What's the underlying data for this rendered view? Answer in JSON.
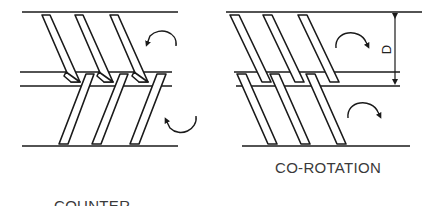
{
  "diagram": {
    "panels": [
      {
        "id": "counter-rotation",
        "label_line1": "COUNTER-",
        "label_line2": "ROTATION",
        "rotation": {
          "upper_screw": "counter-clockwise",
          "lower_screw": "clockwise"
        }
      },
      {
        "id": "co-rotation",
        "label": "CO-ROTATION",
        "rotation": {
          "upper_screw": "clockwise",
          "lower_screw": "clockwise"
        },
        "dimension_label": "D"
      }
    ],
    "colors": {
      "line": "#1a1a1a",
      "text": "#3a3a3a",
      "background": "#ffffff"
    }
  }
}
